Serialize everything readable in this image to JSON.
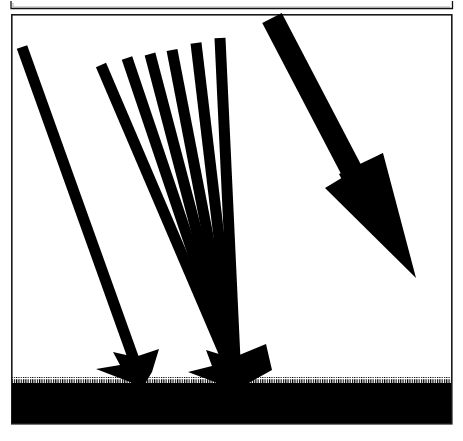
{
  "figure": {
    "title": "Ray diagram: converging ray fan, single oblique ray, and large resultant arrow striking a hatched ground plane",
    "kind": "line-art-diagram",
    "background_color": "#ffffff",
    "ink_color": "#000000",
    "canvas": {
      "width": 463,
      "height": 441
    },
    "partial_box_above": {
      "name": "cropped-box-bottom-edge",
      "description": "bottom edge of a preceding framed panel, cropped by the top of the image",
      "x": 11,
      "y": 1,
      "width": 442,
      "height": 8,
      "stroke_width": 1.2
    },
    "frame": {
      "name": "main-panel-frame",
      "description": "thin rectangular border enclosing the whole diagram",
      "x": 11,
      "y": 14,
      "width": 441,
      "height": 410,
      "stroke_width": 1.6,
      "stroke_color": "#1a1a1a"
    },
    "ground": {
      "name": "ground-plane",
      "description": "solid black ground band with finely serrated (hatched) upper edge",
      "top_y": 383,
      "bottom_y": 423,
      "left_x": 12,
      "right_x": 451,
      "serration_tooth_width": 1.15,
      "serration_tooth_height": 6,
      "fill": "#000000"
    },
    "left_ray": {
      "name": "left-oblique-ray",
      "label": "single oblique ray",
      "head_x": 22,
      "head_y": 47,
      "tip_x": 143,
      "tip_y": 385,
      "shaft_width": 11,
      "arrowhead_length": 30,
      "arrowhead_half_width": 17,
      "angle_from_vertical_deg": 19
    },
    "fan": {
      "name": "converging-ray-fan",
      "label": "fan of converging rays",
      "ray_count": 6,
      "convergence_x": 236,
      "convergence_y": 381,
      "shaft_width": 11,
      "arrowhead_length": 34,
      "arrowhead_half_width": 24,
      "rays": [
        {
          "index": 1,
          "start_x": 101,
          "start_y": 65,
          "angle_from_vertical_deg": 20.6
        },
        {
          "index": 2,
          "start_x": 127,
          "start_y": 58,
          "angle_from_vertical_deg": 17.0
        },
        {
          "index": 3,
          "start_x": 150,
          "start_y": 54,
          "angle_from_vertical_deg": 13.6
        },
        {
          "index": 4,
          "start_x": 172,
          "start_y": 50,
          "angle_from_vertical_deg": 10.0
        },
        {
          "index": 5,
          "start_x": 196,
          "start_y": 43,
          "angle_from_vertical_deg": 6.3
        },
        {
          "index": 6,
          "start_x": 220,
          "start_y": 38,
          "angle_from_vertical_deg": 2.6
        }
      ]
    },
    "right_arrow": {
      "name": "resultant-arrow",
      "label": "large resultant arrow",
      "tail_x": 272,
      "tail_y": 18,
      "tip_x": 416,
      "tip_y": 278,
      "shaft_width": 22,
      "arrowhead_length": 128,
      "arrowhead_back_left_x": 325,
      "arrowhead_back_left_y": 188,
      "arrowhead_back_right_x": 378,
      "arrowhead_back_right_y": 155,
      "angle_from_vertical_deg": 29
    }
  }
}
